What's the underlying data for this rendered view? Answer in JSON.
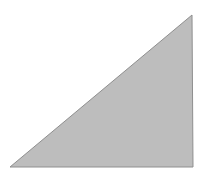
{
  "figure": {
    "shape": "right-triangle",
    "fill_color": "#bdbdbd",
    "stroke_color": "#8f8f8f",
    "background_color": "#ffffff",
    "vertices": [
      [
        10,
        167
      ],
      [
        192,
        15
      ],
      [
        193,
        167
      ]
    ]
  }
}
